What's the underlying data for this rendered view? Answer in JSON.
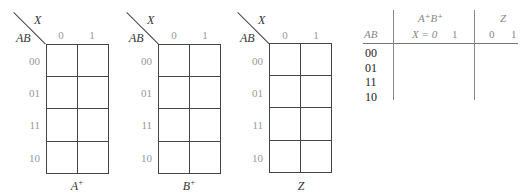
{
  "kmaps": [
    {
      "title_base": "A",
      "title_sup": "+",
      "col_var": "X",
      "row_var": "AB",
      "col_labels": [
        "0",
        "1"
      ],
      "row_labels": [
        "00",
        "01",
        "11",
        "10"
      ]
    },
    {
      "title_base": "B",
      "title_sup": "+",
      "col_var": "X",
      "row_var": "AB",
      "col_labels": [
        "0",
        "1"
      ],
      "row_labels": [
        "00",
        "01",
        "11",
        "10"
      ]
    },
    {
      "title_base": "Z",
      "title_sup": "",
      "col_var": "X",
      "row_var": "AB",
      "col_labels": [
        "0",
        "1"
      ],
      "row_labels": [
        "00",
        "01",
        "11",
        "10"
      ]
    }
  ],
  "table": {
    "group1_header": "A⁺B⁺",
    "group2_header": "Z",
    "row_header": "AB",
    "group1_cols": [
      "X = 0",
      "1"
    ],
    "group2_cols": [
      "0",
      "1"
    ],
    "rows": [
      "00",
      "01",
      "11",
      "10"
    ]
  }
}
